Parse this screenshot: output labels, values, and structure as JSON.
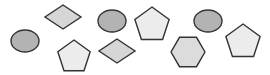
{
  "canvas": {
    "width": 270,
    "height": 75,
    "background": "#ffffff"
  },
  "colors": {
    "outline": "#333333",
    "ellipse_fill": "#b3b3b3",
    "diamond_fill": "#d6d6d6",
    "pentagon_fill": "#ececec",
    "hexagon_fill": "#dcdcdc"
  },
  "shapes": [
    {
      "type": "ellipse",
      "cx": 25,
      "cy": 41,
      "rx": 14,
      "ry": 11,
      "fill": "#b3b3b3"
    },
    {
      "type": "diamond",
      "cx": 63,
      "cy": 17,
      "hw": 18,
      "hh": 12,
      "fill": "#d6d6d6"
    },
    {
      "type": "ellipse",
      "cx": 112,
      "cy": 21,
      "rx": 14,
      "ry": 11,
      "fill": "#b3b3b3"
    },
    {
      "type": "pentagon",
      "cx": 152,
      "cy": 25,
      "r": 18,
      "fill": "#ececec"
    },
    {
      "type": "ellipse",
      "cx": 208,
      "cy": 21,
      "rx": 14,
      "ry": 11,
      "fill": "#b3b3b3"
    },
    {
      "type": "pentagon",
      "cx": 243,
      "cy": 42,
      "r": 18,
      "fill": "#ececec"
    },
    {
      "type": "pentagon",
      "cx": 74,
      "cy": 57,
      "r": 17,
      "fill": "#ececec"
    },
    {
      "type": "diamond",
      "cx": 117,
      "cy": 51,
      "hw": 18,
      "hh": 12,
      "fill": "#d6d6d6"
    },
    {
      "type": "hexagon",
      "cx": 188,
      "cy": 52,
      "r": 17,
      "fill": "#dcdcdc"
    }
  ]
}
